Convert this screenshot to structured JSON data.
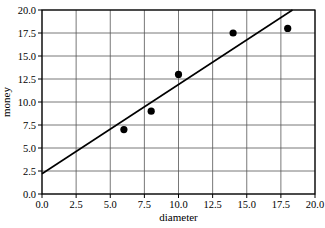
{
  "chart_data": {
    "type": "scatter",
    "title": "",
    "xlabel": "diameter",
    "ylabel": "money",
    "xlim": [
      0,
      20
    ],
    "ylim": [
      0,
      20
    ],
    "xticks": [
      "0.0",
      "2.5",
      "5.0",
      "7.5",
      "10.0",
      "12.5",
      "15.0",
      "17.5",
      "20.0"
    ],
    "yticks": [
      "0.0",
      "2.5",
      "5.0",
      "7.5",
      "10.0",
      "12.5",
      "15.0",
      "17.5",
      "20.0"
    ],
    "grid": true,
    "legend": null,
    "series": [
      {
        "name": "points",
        "type": "scatter",
        "x": [
          6,
          8,
          10,
          14,
          18
        ],
        "y": [
          7,
          9,
          13,
          17.5,
          18
        ]
      },
      {
        "name": "fit line",
        "type": "line",
        "intercept": 2.2,
        "slope": 0.97
      }
    ]
  }
}
